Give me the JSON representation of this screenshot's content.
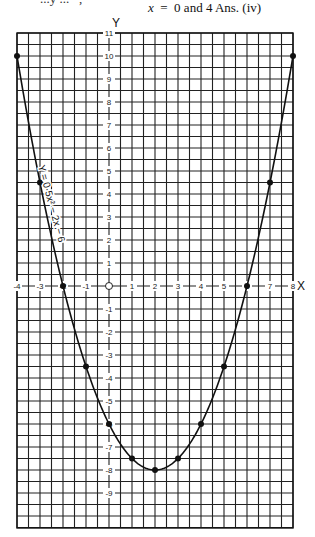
{
  "header": {
    "text_var": "x",
    "text_rest": "  =  0 and 4 Ans. (iv)",
    "top_cut_text": "...y ...   ,"
  },
  "chart_data": {
    "type": "line",
    "title": "",
    "equation_label": "Y = 0·5x² − 2x − 6",
    "xlabel": "X",
    "ylabel": "Y",
    "xlim": [
      -4,
      8
    ],
    "ylim": [
      -10.5,
      11
    ],
    "grid": true,
    "grid_minor_step": 0.5,
    "x_ticks": [
      -4,
      -3,
      -2,
      -1,
      0,
      1,
      2,
      3,
      4,
      5,
      6,
      7,
      8
    ],
    "y_ticks": [
      11,
      10,
      9,
      8,
      7,
      6,
      5,
      4,
      3,
      2,
      1,
      -1,
      -2,
      -3,
      -4,
      -5,
      -6,
      -7,
      -8,
      -9
    ],
    "origin_label": "O",
    "series": [
      {
        "name": "y = 0.5x^2 - 2x - 6",
        "x": [
          -4,
          -3,
          -2,
          -1,
          0,
          1,
          2,
          3,
          4,
          5,
          6,
          7,
          8
        ],
        "y": [
          10,
          4.5,
          0,
          -3.5,
          -6,
          -7.5,
          -8,
          -7.5,
          -6,
          -3.5,
          0,
          4.5,
          10
        ]
      }
    ],
    "annotations": [
      "roots at x = -2 and x = 6",
      "minimum at (2, -8)"
    ]
  }
}
